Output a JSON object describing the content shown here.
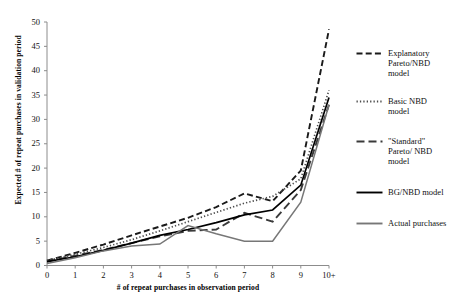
{
  "chart_data": {
    "type": "line",
    "title": "",
    "xlabel": "# of repeat purchases in observation period",
    "ylabel": "Expected # of repeat purchases in validation period",
    "x": [
      0,
      1,
      2,
      3,
      4,
      5,
      6,
      7,
      8,
      9,
      10
    ],
    "xtick_labels": [
      "0",
      "1",
      "2",
      "3",
      "4",
      "5",
      "6",
      "7",
      "8",
      "9",
      "10+"
    ],
    "ytick_labels": [
      "0",
      "5",
      "10",
      "15",
      "20",
      "25",
      "30",
      "35",
      "40",
      "45",
      "50"
    ],
    "xlim": [
      0,
      10
    ],
    "ylim": [
      0,
      50
    ],
    "grid": false,
    "legend_position": "right",
    "series": [
      {
        "name": "Explanatory Pareto/NBD model",
        "style": "dashed",
        "color": "#1a1a1a",
        "values": [
          1.0,
          2.6,
          4.3,
          6.2,
          8.0,
          9.8,
          12.0,
          14.8,
          13.2,
          19.5,
          48.5
        ]
      },
      {
        "name": "Basic NBD model",
        "style": "dotted",
        "color": "#4d4d4d",
        "values": [
          1.0,
          2.3,
          3.7,
          5.3,
          7.1,
          9.0,
          10.9,
          12.8,
          14.2,
          17.8,
          36.0
        ]
      },
      {
        "name": "\"Standard\" Pareto/ NBD model",
        "style": "dash-long",
        "color": "#3a3a3a",
        "values": [
          0.8,
          2.0,
          3.2,
          4.6,
          6.0,
          7.1,
          7.4,
          10.8,
          9.0,
          15.5,
          33.0
        ]
      },
      {
        "name": "BG/NBD model",
        "style": "solid",
        "color": "#000000",
        "values": [
          0.8,
          1.8,
          3.1,
          4.6,
          6.2,
          7.4,
          8.8,
          10.4,
          11.4,
          16.5,
          34.5
        ]
      },
      {
        "name": "Actual purchases",
        "style": "solid-gray",
        "color": "#777777",
        "values": [
          0.4,
          1.6,
          3.0,
          4.0,
          4.4,
          8.2,
          6.5,
          5.0,
          5.0,
          13.0,
          33.0
        ]
      }
    ]
  },
  "legend": {
    "entries": [
      {
        "label_lines": [
          "Explanatory",
          "Pareto/NBD",
          "model"
        ],
        "style": "dashed"
      },
      {
        "label_lines": [
          "Basic NBD",
          "model"
        ],
        "style": "dotted"
      },
      {
        "label_lines": [
          "\"Standard\"",
          "Pareto/ NBD",
          "model"
        ],
        "style": "dash-long"
      },
      {
        "label_lines": [
          "BG/NBD model"
        ],
        "style": "solid"
      },
      {
        "label_lines": [
          "Actual purchases"
        ],
        "style": "solid-gray"
      }
    ]
  }
}
